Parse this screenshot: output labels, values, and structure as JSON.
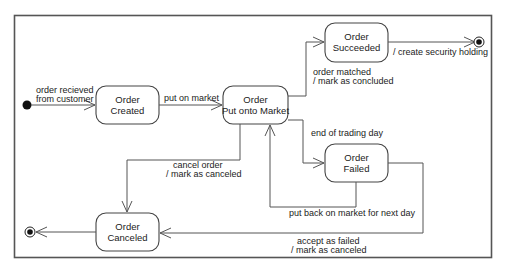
{
  "diagram": {
    "type": "uml-state-machine",
    "states": {
      "created": {
        "line1": "Order",
        "line2": "Created"
      },
      "market": {
        "line1": "Order",
        "line2": "Put onto Market"
      },
      "succeeded": {
        "line1": "Order",
        "line2": "Succeeded"
      },
      "failed": {
        "line1": "Order",
        "line2": "Failed"
      },
      "canceled": {
        "line1": "Order",
        "line2": "Canceled"
      }
    },
    "transitions": {
      "received": {
        "line1": "order recieved",
        "line2": "from customer"
      },
      "put_on_market": {
        "line1": "put on market"
      },
      "matched": {
        "line1": "order matched",
        "line2": "/ mark as concluded"
      },
      "create_holding": {
        "line1": "/ create security holding"
      },
      "end_of_day": {
        "line1": "end of trading day"
      },
      "cancel": {
        "line1": "cancel order",
        "line2": "/ mark as canceled"
      },
      "put_back": {
        "line1": "put back on market for next day"
      },
      "accept_failed": {
        "line1": "accept as failed",
        "line2": "/ mark as canceled"
      }
    }
  }
}
